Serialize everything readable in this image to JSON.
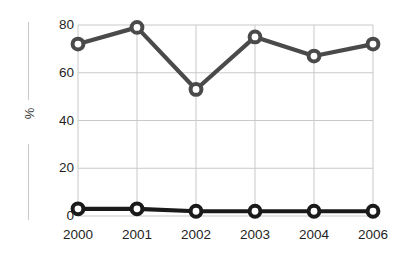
{
  "chart_data": {
    "type": "line",
    "title": "",
    "xlabel": "",
    "ylabel": "%",
    "categories": [
      "2000",
      "2001",
      "2002",
      "2003",
      "2004",
      "2006"
    ],
    "ylim": [
      0,
      80
    ],
    "yticks": [
      0,
      20,
      40,
      60,
      80
    ],
    "ytick_labels": [
      "0",
      "20",
      "40",
      "60",
      "80"
    ],
    "grid": true,
    "legend": "none",
    "series": [
      {
        "name": "upper-series",
        "color": "#4a4a4a",
        "marker": "open-circle",
        "values": [
          72,
          79,
          53,
          75,
          67,
          72
        ]
      },
      {
        "name": "lower-series",
        "color": "#1a1a1a",
        "marker": "open-circle",
        "values": [
          3,
          3,
          2,
          2,
          2,
          2
        ]
      }
    ]
  },
  "style": {
    "background": "#ffffff",
    "grid_color": "#c9c9c9",
    "axis_rule_color": "#c9c9c9",
    "tick_text_color": "#1f1f1f",
    "marker_fill": "#ffffff"
  }
}
